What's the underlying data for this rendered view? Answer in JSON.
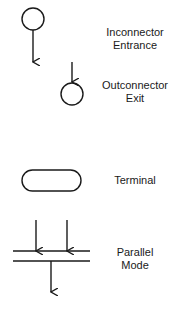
{
  "legend": {
    "items": [
      {
        "id": "inconnector",
        "symbol": "circle-with-outgoing-arrow",
        "lines": [
          "Inconnector",
          "Entrance"
        ]
      },
      {
        "id": "outconnector",
        "symbol": "incoming-arrow-to-circle",
        "lines": [
          "Outconnector",
          "Exit"
        ]
      },
      {
        "id": "terminal",
        "symbol": "rounded-rectangle",
        "lines": [
          "Terminal"
        ]
      },
      {
        "id": "parallel",
        "symbol": "double-bar-with-arrows",
        "lines": [
          "Parallel",
          "Mode"
        ]
      }
    ]
  },
  "colors": {
    "stroke": "#1a1a1a",
    "background": "#ffffff"
  }
}
